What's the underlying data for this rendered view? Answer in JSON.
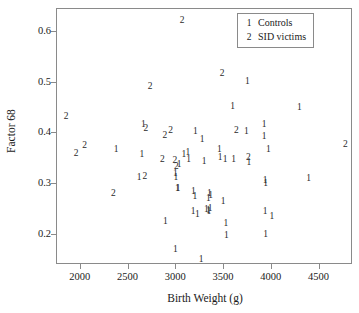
{
  "chart_data": {
    "type": "scatter",
    "title": "",
    "xlabel": "Birth Weight (g)",
    "ylabel": "Factor 68",
    "xlim": [
      1750,
      4850
    ],
    "ylim": [
      0.14,
      0.645
    ],
    "xticks": [
      2000,
      2500,
      3000,
      3500,
      4000,
      4500
    ],
    "yticks": [
      0.2,
      0.3,
      0.4,
      0.5,
      0.6
    ],
    "ytick_labels": [
      "0.2",
      "0.3",
      "0.4",
      "0.5",
      "0.6"
    ],
    "xtick_labels": [
      "2000",
      "2500",
      "3000",
      "3500",
      "4000",
      "4500"
    ],
    "grid": false,
    "legend_position": "top-right",
    "marker_style": "group-number-glyph",
    "series": [
      {
        "name": "Controls",
        "key": "1",
        "points": [
          [
            2380,
            0.365
          ],
          [
            2665,
            0.415
          ],
          [
            2650,
            0.355
          ],
          [
            2620,
            0.31
          ],
          [
            3090,
            0.355
          ],
          [
            3130,
            0.358
          ],
          [
            3140,
            0.345
          ],
          [
            3210,
            0.4
          ],
          [
            3280,
            0.385
          ],
          [
            3300,
            0.342
          ],
          [
            3460,
            0.365
          ],
          [
            3470,
            0.35
          ],
          [
            3520,
            0.345
          ],
          [
            3610,
            0.345
          ],
          [
            3600,
            0.45
          ],
          [
            3745,
            0.4
          ],
          [
            3755,
            0.5
          ],
          [
            3770,
            0.34
          ],
          [
            3930,
            0.415
          ],
          [
            3930,
            0.39
          ],
          [
            3975,
            0.365
          ],
          [
            4300,
            0.447
          ],
          [
            3940,
            0.303
          ],
          [
            3945,
            0.298
          ],
          [
            4395,
            0.307
          ],
          [
            3040,
            0.335
          ],
          [
            3000,
            0.318
          ],
          [
            3005,
            0.31
          ],
          [
            3020,
            0.288
          ],
          [
            3030,
            0.287
          ],
          [
            3190,
            0.283
          ],
          [
            3205,
            0.272
          ],
          [
            3345,
            0.268
          ],
          [
            3355,
            0.278
          ],
          [
            3370,
            0.275
          ],
          [
            3325,
            0.247
          ],
          [
            3345,
            0.245
          ],
          [
            3350,
            0.243
          ],
          [
            3365,
            0.248
          ],
          [
            3185,
            0.243
          ],
          [
            3230,
            0.237
          ],
          [
            2895,
            0.222
          ],
          [
            3500,
            0.262
          ],
          [
            3530,
            0.218
          ],
          [
            3535,
            0.195
          ],
          [
            3940,
            0.243
          ],
          [
            4010,
            0.232
          ],
          [
            3945,
            0.198
          ],
          [
            3000,
            0.168
          ],
          [
            3270,
            0.148
          ]
        ]
      },
      {
        "name": "SID victims",
        "key": "2",
        "points": [
          [
            1855,
            0.43
          ],
          [
            1960,
            0.357
          ],
          [
            2050,
            0.372
          ],
          [
            2350,
            0.278
          ],
          [
            2690,
            0.407
          ],
          [
            2735,
            0.49
          ],
          [
            2865,
            0.345
          ],
          [
            2890,
            0.393
          ],
          [
            2950,
            0.402
          ],
          [
            2995,
            0.343
          ],
          [
            3010,
            0.332
          ],
          [
            2680,
            0.312
          ],
          [
            3070,
            0.62
          ],
          [
            3490,
            0.515
          ],
          [
            3640,
            0.402
          ],
          [
            3765,
            0.35
          ],
          [
            4780,
            0.375
          ]
        ]
      }
    ]
  },
  "legend": {
    "items": [
      {
        "key": "1",
        "label": "Controls"
      },
      {
        "key": "2",
        "label": "SID victims"
      }
    ]
  },
  "colors": {
    "axis": "#8a8a8a",
    "text": "#1a1a1a",
    "marker": "#2a2a2a",
    "background": "#ffffff"
  }
}
